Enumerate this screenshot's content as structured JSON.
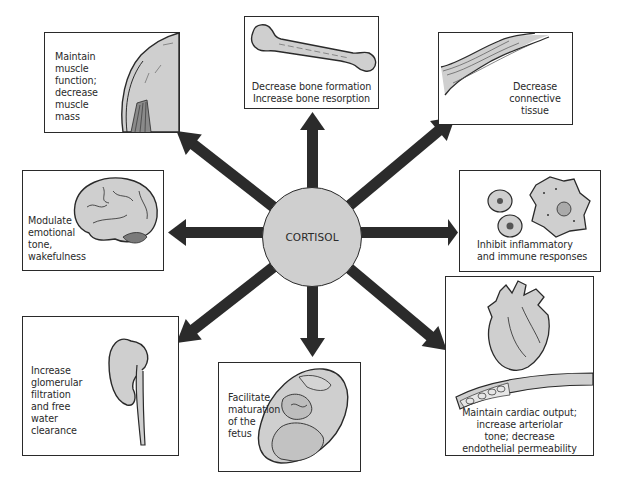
{
  "diagram": {
    "center": {
      "label": "CORTISOL",
      "fill": "#cfcfcf"
    },
    "arrow_color": "#2b2b2b",
    "illustration_fill": "#cfcfcf",
    "effects": [
      {
        "id": "muscle",
        "lines": [
          "Maintain",
          "muscle",
          "function;",
          "decrease",
          "muscle",
          "mass"
        ],
        "icon": "muscle-illustration",
        "direction": "upper-left"
      },
      {
        "id": "bone",
        "lines": [
          "Decrease bone formation",
          "Increase bone resorption"
        ],
        "icon": "bone-illustration",
        "direction": "up"
      },
      {
        "id": "connective",
        "lines": [
          "Decrease",
          "connective",
          "tissue"
        ],
        "icon": "connective-tissue-illustration",
        "direction": "upper-right"
      },
      {
        "id": "brain",
        "lines": [
          "Modulate",
          "emotional",
          "tone,",
          "wakefulness"
        ],
        "icon": "brain-illustration",
        "direction": "left"
      },
      {
        "id": "immune",
        "lines": [
          "Inhibit inflammatory",
          "and immune responses"
        ],
        "icon": "immune-cells-illustration",
        "direction": "right"
      },
      {
        "id": "kidney",
        "lines": [
          "Increase",
          "glomerular",
          "filtration",
          "and free",
          "water",
          "clearance"
        ],
        "icon": "kidney-illustration",
        "direction": "lower-left"
      },
      {
        "id": "fetus",
        "lines": [
          "Facilitate",
          "maturation",
          "of the",
          "fetus"
        ],
        "icon": "fetus-illustration",
        "direction": "down"
      },
      {
        "id": "cardiac",
        "lines": [
          "Maintain cardiac output;",
          "increase arteriolar",
          "tone; decrease",
          "endothelial permeability"
        ],
        "icon": "heart-vessel-illustration",
        "direction": "lower-right"
      }
    ]
  }
}
